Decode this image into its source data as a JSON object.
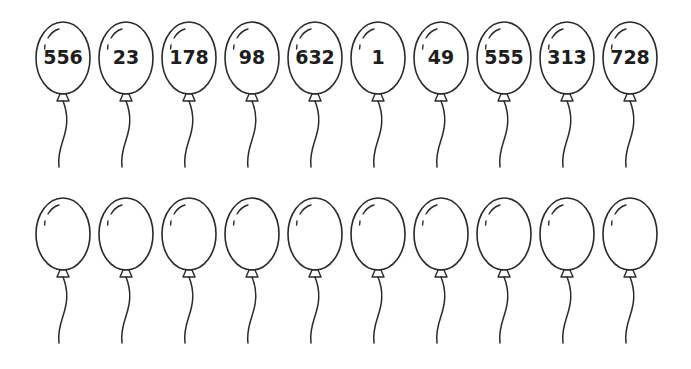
{
  "worksheet": {
    "top_row": {
      "balloons": [
        {
          "label": "556"
        },
        {
          "label": "23"
        },
        {
          "label": "178"
        },
        {
          "label": "98"
        },
        {
          "label": "632"
        },
        {
          "label": "1"
        },
        {
          "label": "49"
        },
        {
          "label": "555"
        },
        {
          "label": "313"
        },
        {
          "label": "728"
        }
      ]
    },
    "bottom_row": {
      "balloons": [
        {
          "label": ""
        },
        {
          "label": ""
        },
        {
          "label": ""
        },
        {
          "label": ""
        },
        {
          "label": ""
        },
        {
          "label": ""
        },
        {
          "label": ""
        },
        {
          "label": ""
        },
        {
          "label": ""
        },
        {
          "label": ""
        }
      ]
    },
    "colors": {
      "outline": "#2a2a2a",
      "background": "#ffffff",
      "text": "#1e1e1e"
    }
  }
}
